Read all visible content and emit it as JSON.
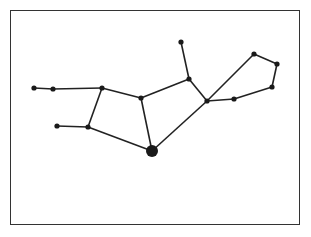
{
  "diagram": {
    "type": "constellation",
    "colors": {
      "line": "#222222",
      "star": "#1a1a1a",
      "frame": "#333333",
      "background": "#ffffff"
    },
    "stars": [
      {
        "id": "A",
        "x": 34,
        "y": 88,
        "r": 2.6
      },
      {
        "id": "B",
        "x": 53,
        "y": 89,
        "r": 2.6
      },
      {
        "id": "C",
        "x": 102,
        "y": 88,
        "r": 2.6
      },
      {
        "id": "D",
        "x": 141,
        "y": 98,
        "r": 2.6
      },
      {
        "id": "E",
        "x": 189,
        "y": 79,
        "r": 2.6
      },
      {
        "id": "F",
        "x": 181,
        "y": 42,
        "r": 2.6
      },
      {
        "id": "G",
        "x": 207,
        "y": 101,
        "r": 2.6
      },
      {
        "id": "H",
        "x": 254,
        "y": 54,
        "r": 2.6
      },
      {
        "id": "I",
        "x": 277,
        "y": 64,
        "r": 2.6
      },
      {
        "id": "J",
        "x": 272,
        "y": 87,
        "r": 2.6
      },
      {
        "id": "K",
        "x": 234,
        "y": 99,
        "r": 2.6
      },
      {
        "id": "L",
        "x": 152,
        "y": 151,
        "r": 6
      },
      {
        "id": "M",
        "x": 88,
        "y": 127,
        "r": 2.6
      },
      {
        "id": "N",
        "x": 57,
        "y": 126,
        "r": 2.6
      }
    ],
    "edges": [
      [
        "A",
        "B"
      ],
      [
        "B",
        "C"
      ],
      [
        "C",
        "D"
      ],
      [
        "D",
        "E"
      ],
      [
        "E",
        "F"
      ],
      [
        "E",
        "G"
      ],
      [
        "G",
        "H"
      ],
      [
        "H",
        "I"
      ],
      [
        "I",
        "J"
      ],
      [
        "J",
        "K"
      ],
      [
        "K",
        "G"
      ],
      [
        "G",
        "L"
      ],
      [
        "D",
        "L"
      ],
      [
        "C",
        "M"
      ],
      [
        "M",
        "L"
      ],
      [
        "N",
        "M"
      ]
    ]
  }
}
